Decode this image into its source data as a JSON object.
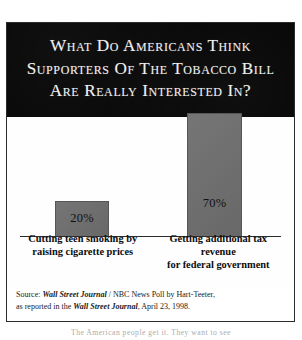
{
  "title": {
    "line1": "What Do Americans Think",
    "line2": "Supporters Of The Tobacco Bill",
    "line3": "Are Really Interested In?"
  },
  "chart_data": {
    "type": "bar",
    "title": "What Do Americans Think Supporters Of The Tobacco Bill Are Really Interested In?",
    "categories": [
      "Cutting teen smoking by raising cigarette prices",
      "Getting additional tax revenue for federal government"
    ],
    "category_lines": [
      [
        "Cutting teen smoking by",
        "raising cigarette prices"
      ],
      [
        "Getting additional tax revenue",
        "for federal government"
      ]
    ],
    "values": [
      20,
      70
    ],
    "value_labels": [
      "20%",
      "70%"
    ],
    "xlabel": "",
    "ylabel": "",
    "ylim": [
      0,
      80
    ],
    "grid": false,
    "legend": false,
    "bar_color": "#6e6e6e",
    "axis_color": "#2b2b2b"
  },
  "source": {
    "line1_prefix": "Source: ",
    "line1_italic": "Wall Street Journal",
    "line1_suffix": " / NBC News Poll by Hart-Teeter,",
    "line2_prefix": "as reported in the ",
    "line2_italic": "Wall Street Journal",
    "line2_suffix": ", April 23, 1998."
  },
  "page_text": {
    "excerpt": "The American people get it. They want to see"
  },
  "colors": {
    "title_background": "#060606",
    "title_text": "#efefef",
    "bar_fill": "#6e6e6e",
    "border": "#2b2b2b",
    "page_background": "#ffffff"
  }
}
